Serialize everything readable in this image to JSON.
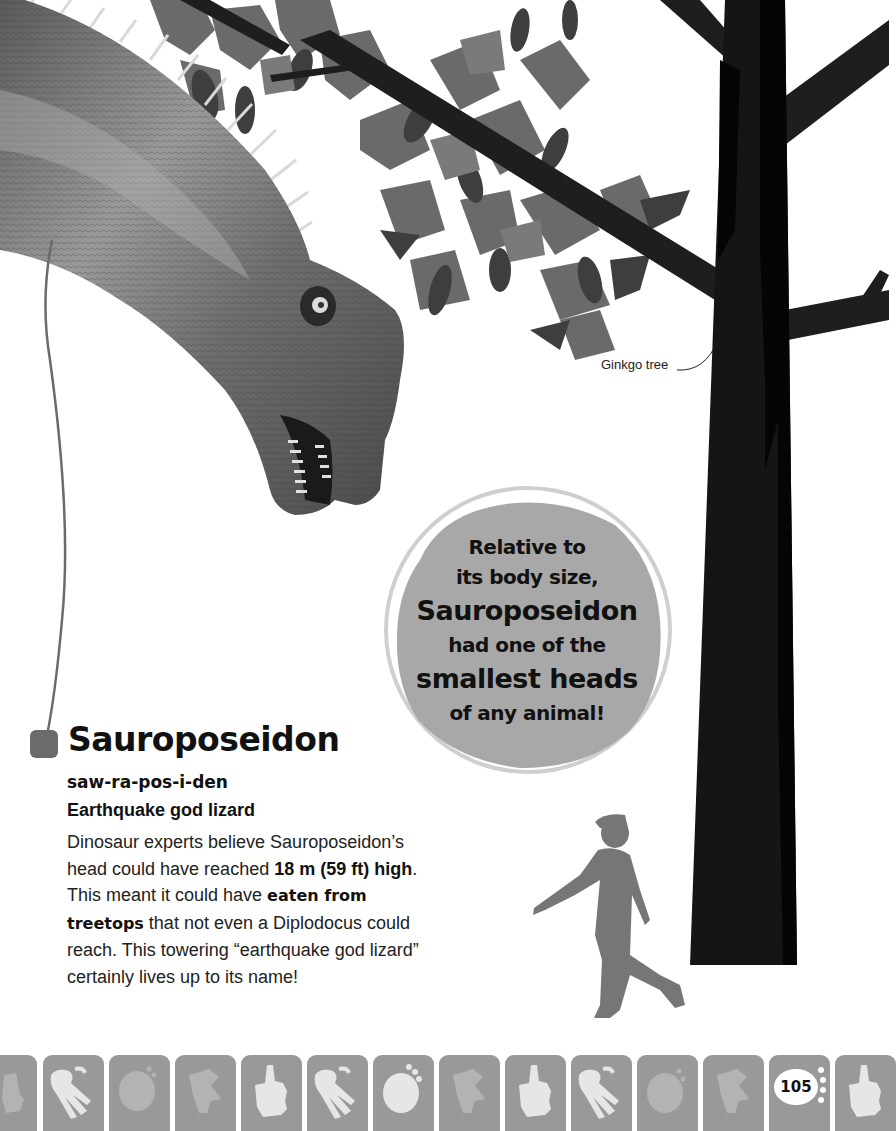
{
  "page": {
    "number": "105",
    "background": "#ffffff"
  },
  "illustration": {
    "dinosaur": "Sauroposeidon head and neck",
    "tree_label": "Ginkgo tree",
    "silhouette": "child-walking-silhouette"
  },
  "fact_bubble": {
    "lines": [
      {
        "text": "Relative to",
        "size": "small"
      },
      {
        "text": "its body size,",
        "size": "small"
      },
      {
        "text": "Sauroposeidon",
        "size": "large"
      },
      {
        "text": "had one of the",
        "size": "small"
      },
      {
        "text": "smallest heads",
        "size": "large"
      },
      {
        "text": "of any animal!",
        "size": "small"
      }
    ]
  },
  "entry": {
    "name": "Sauroposeidon",
    "pronunciation": "saw-ra-pos-i-den",
    "meaning": "Earthquake god lizard",
    "body": {
      "p1": "Dinosaur experts believe Sauroposeidon’s head could have reached ",
      "b1": "18 m (59 ft) high",
      "p2": ". This meant it could have ",
      "b2": "eaten from treetops",
      "p3": " that not even a Diplodocus could reach. This towering “earthquake god lizard” certainly lives up to its name!"
    }
  },
  "footer": {
    "tiles": [
      {
        "icon": "hand-print-icon",
        "style": "faded"
      },
      {
        "icon": "three-toe-footprint-icon",
        "style": "bright"
      },
      {
        "icon": "round-footprint-icon",
        "style": "faded"
      },
      {
        "icon": "claw-footprint-icon",
        "style": "faded"
      },
      {
        "icon": "hand-print-icon",
        "style": "bright"
      },
      {
        "icon": "three-toe-footprint-icon",
        "style": "bright"
      },
      {
        "icon": "round-footprint-icon",
        "style": "bright"
      },
      {
        "icon": "claw-footprint-icon",
        "style": "faded"
      },
      {
        "icon": "hand-print-icon",
        "style": "bright"
      },
      {
        "icon": "three-toe-footprint-icon",
        "style": "bright"
      },
      {
        "icon": "round-footprint-icon",
        "style": "faded"
      },
      {
        "icon": "claw-footprint-icon",
        "style": "faded"
      },
      {
        "icon": "page-number-footprint",
        "style": "page"
      },
      {
        "icon": "hand-print-icon",
        "style": "bright"
      }
    ],
    "colors": {
      "tile": "#999999",
      "bright_icon": "#e6e6e6",
      "faded_icon": "#b3b3b3"
    }
  }
}
